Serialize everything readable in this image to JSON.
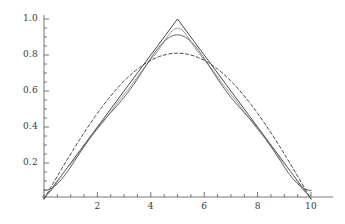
{
  "figure": {
    "kind": "mathematica-plot",
    "background": "#ffffff",
    "axis_color": "#555555",
    "label_color": "#3a3a3a",
    "width": 345,
    "height": 224
  },
  "axes": {
    "x": {
      "label": "",
      "min": 0,
      "max": 10,
      "tick_labels": [
        "2",
        "4",
        "6",
        "8",
        "10"
      ],
      "tick_values": [
        2,
        4,
        6,
        8,
        10
      ],
      "minor_tick_step": 0.5,
      "pixel_origin": 44,
      "pixel_end": 311,
      "baseline_y": 197
    },
    "y": {
      "label": "",
      "min": 0,
      "max": 1.0,
      "tick_labels": [
        "0.2",
        "0.4",
        "0.6",
        "0.8",
        "1.0"
      ],
      "tick_values": [
        0.2,
        0.4,
        0.6,
        0.8,
        1.0
      ],
      "minor_tick_step": 0.05,
      "pixel_top": 19,
      "pixel_zero": 199,
      "axis_x": 44
    }
  },
  "chart_data": {
    "type": "line",
    "title": "",
    "xlabel": "",
    "ylabel": "",
    "xlim": [
      0,
      10
    ],
    "ylim": [
      0,
      1.0
    ],
    "grid": false,
    "legend": "none",
    "x_tick_labels": [
      "2",
      "4",
      "6",
      "8",
      "10"
    ],
    "y_tick_labels": [
      "0.2",
      "0.4",
      "0.6",
      "0.8",
      "1.0"
    ],
    "x": [
      0,
      0.25,
      0.5,
      0.75,
      1,
      1.25,
      1.5,
      1.75,
      2,
      2.25,
      2.5,
      2.75,
      3,
      3.25,
      3.5,
      3.75,
      4,
      4.25,
      4.5,
      4.75,
      5,
      5.25,
      5.5,
      5.75,
      6,
      6.25,
      6.5,
      6.75,
      7,
      7.25,
      7.5,
      7.75,
      8,
      8.25,
      8.5,
      8.75,
      9,
      9.25,
      9.5,
      9.75,
      10
    ],
    "series": [
      {
        "name": "triangle-wave",
        "peak": 1.0,
        "peak_x": 5,
        "style": "solid",
        "color": "#4a4a4a",
        "width": 1.0,
        "values": [
          0,
          0.05,
          0.1,
          0.15,
          0.2,
          0.25,
          0.3,
          0.35,
          0.4,
          0.45,
          0.5,
          0.55,
          0.6,
          0.65,
          0.7,
          0.75,
          0.8,
          0.85,
          0.9,
          0.95,
          1.0,
          0.95,
          0.9,
          0.85,
          0.8,
          0.75,
          0.7,
          0.65,
          0.6,
          0.55,
          0.5,
          0.45,
          0.4,
          0.35,
          0.3,
          0.25,
          0.2,
          0.15,
          0.1,
          0.05,
          0
        ]
      },
      {
        "name": "fourier-partial-sum-high",
        "peak": 0.949,
        "peak_x": 5,
        "style": "solid",
        "color": "#9a9a9a",
        "width": 1.0,
        "values": [
          0,
          0.0627,
          0.1136,
          0.1588,
          0.2057,
          0.2562,
          0.3063,
          0.3545,
          0.4033,
          0.4535,
          0.5035,
          0.5524,
          0.6016,
          0.6518,
          0.7016,
          0.7497,
          0.7966,
          0.8436,
          0.8876,
          0.9232,
          0.949,
          0.9232,
          0.8876,
          0.8436,
          0.7966,
          0.7497,
          0.7016,
          0.6518,
          0.6016,
          0.5524,
          0.5035,
          0.4535,
          0.4033,
          0.3545,
          0.3063,
          0.2562,
          0.2057,
          0.1588,
          0.1136,
          0.0627,
          0
        ]
      },
      {
        "name": "fourier-partial-sum-mid",
        "peak": 0.912,
        "peak_x": 5,
        "style": "solid",
        "color": "#5e5e5e",
        "width": 1.0,
        "values": [
          0,
          0.0685,
          0.1232,
          0.1661,
          0.2112,
          0.2641,
          0.3153,
          0.3598,
          0.407,
          0.4598,
          0.5098,
          0.5545,
          0.601,
          0.653,
          0.7021,
          0.7448,
          0.7851,
          0.8271,
          0.8646,
          0.8923,
          0.912,
          0.8923,
          0.8646,
          0.8271,
          0.7851,
          0.7448,
          0.7021,
          0.653,
          0.601,
          0.5545,
          0.5098,
          0.4598,
          0.407,
          0.3598,
          0.3153,
          0.2641,
          0.2112,
          0.1661,
          0.1232,
          0.0685,
          0
        ]
      },
      {
        "name": "fundamental-sine-mode",
        "peak": 0.81,
        "peak_x": 5,
        "style": "dashed",
        "color": "#4a4a4a",
        "width": 1.0,
        "values": [
          0,
          0.0634,
          0.126,
          0.1869,
          0.2454,
          0.3007,
          0.3522,
          0.3993,
          0.4412,
          0.4776,
          0.5079,
          0.5318,
          0.5491,
          0.5596,
          0.5632,
          0.56,
          0.55,
          0.5336,
          0.511,
          0.4827,
          0.4492,
          0.4113,
          0.3696,
          0.3251,
          0.2785,
          0.2309,
          0.1832,
          0.1363,
          0.0911,
          0.0486,
          0.0096,
          -0.0253,
          -0.0556,
          -0.0807,
          -0.1004,
          -0.1145,
          -0.1228,
          -0.1254,
          -0.1225,
          -0.1143,
          -0.1013
        ]
      }
    ]
  }
}
